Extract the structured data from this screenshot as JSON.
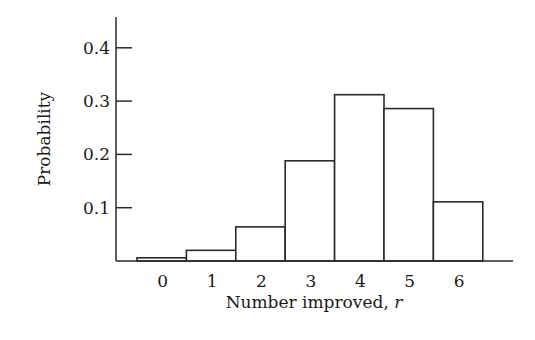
{
  "chart_data": {
    "type": "bar",
    "title": "",
    "xlabel": "Number improved, ",
    "xlabel_var": "r",
    "ylabel": "Probability",
    "categories": [
      "0",
      "1",
      "2",
      "3",
      "4",
      "5",
      "6"
    ],
    "values": [
      0.006,
      0.02,
      0.064,
      0.188,
      0.312,
      0.286,
      0.111
    ],
    "yticks": [
      0.1,
      0.2,
      0.3,
      0.4
    ],
    "ytick_labels": [
      "0.1",
      "0.2",
      "0.3",
      "0.4"
    ],
    "ylim": [
      0,
      0.45
    ],
    "grid": false,
    "legend": null,
    "bar_style": "outlined, no fill, adjacent (histogram)"
  },
  "colors": {
    "line": "#2a2a2a",
    "fill": "#ffffff",
    "background": "#ffffff"
  }
}
